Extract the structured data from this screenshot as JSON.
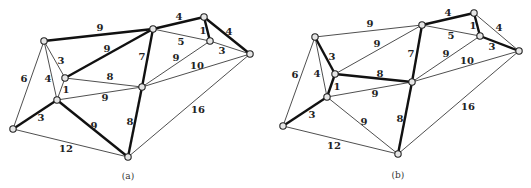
{
  "figures": [
    {
      "id": "a",
      "caption": "(a)",
      "caption_pos": [
        128,
        176
      ],
      "nodes": {
        "A": [
          44,
          41
        ],
        "B": [
          153,
          29
        ],
        "C": [
          204,
          17
        ],
        "D": [
          210,
          41
        ],
        "E": [
          250,
          54
        ],
        "F": [
          65,
          78
        ],
        "G": [
          142,
          87
        ],
        "H": [
          57,
          100
        ],
        "I": [
          13,
          129
        ],
        "J": [
          128,
          157
        ]
      },
      "edges": [
        {
          "from": "A",
          "to": "B",
          "w": "9",
          "thick": true,
          "lp": [
            100,
            28
          ]
        },
        {
          "from": "B",
          "to": "C",
          "w": "4",
          "thick": true,
          "lp": [
            179,
            17
          ]
        },
        {
          "from": "C",
          "to": "D",
          "w": "1",
          "thick": true,
          "lp": [
            203,
            31
          ]
        },
        {
          "from": "C",
          "to": "E",
          "w": "4",
          "thick": true,
          "lp": [
            229,
            32
          ]
        },
        {
          "from": "B",
          "to": "D",
          "w": "5",
          "thick": false,
          "lp": [
            181,
            42
          ]
        },
        {
          "from": "D",
          "to": "E",
          "w": "3",
          "thick": false,
          "lp": [
            222,
            51
          ]
        },
        {
          "from": "B",
          "to": "F",
          "w": "9",
          "thick": true,
          "lp": [
            107,
            49
          ]
        },
        {
          "from": "B",
          "to": "G",
          "w": "7",
          "thick": true,
          "lp": [
            142,
            57
          ]
        },
        {
          "from": "G",
          "to": "D",
          "w": "9",
          "thick": false,
          "lp": [
            176,
            58
          ]
        },
        {
          "from": "G",
          "to": "E",
          "w": "10",
          "thick": false,
          "lp": [
            197,
            66
          ]
        },
        {
          "from": "F",
          "to": "G",
          "w": "8",
          "thick": false,
          "lp": [
            110,
            77
          ]
        },
        {
          "from": "H",
          "to": "G",
          "w": "9",
          "thick": false,
          "lp": [
            105,
            98
          ]
        },
        {
          "from": "A",
          "to": "F",
          "w": "3",
          "thick": false,
          "lp": [
            61,
            61
          ]
        },
        {
          "from": "A",
          "to": "H",
          "w": "4",
          "thick": false,
          "lp": [
            48,
            79
          ]
        },
        {
          "from": "F",
          "to": "H",
          "w": "1",
          "thick": false,
          "lp": [
            66,
            90
          ]
        },
        {
          "from": "A",
          "to": "I",
          "w": "6",
          "thick": false,
          "lp": [
            24,
            79
          ]
        },
        {
          "from": "H",
          "to": "I",
          "w": "3",
          "thick": true,
          "lp": [
            41,
            118
          ]
        },
        {
          "from": "H",
          "to": "J",
          "w": "9",
          "thick": true,
          "lp": [
            94,
            126
          ]
        },
        {
          "from": "G",
          "to": "J",
          "w": "8",
          "thick": true,
          "lp": [
            130,
            122
          ]
        },
        {
          "from": "I",
          "to": "J",
          "w": "12",
          "thick": false,
          "lp": [
            66,
            149
          ]
        },
        {
          "from": "E",
          "to": "J",
          "w": "16",
          "thick": false,
          "lp": [
            198,
            110
          ]
        }
      ]
    },
    {
      "id": "b",
      "caption": "(b)",
      "caption_pos": [
        398,
        175
      ],
      "nodes": {
        "A": [
          315,
          37
        ],
        "B": [
          422,
          25
        ],
        "C": [
          474,
          13
        ],
        "D": [
          480,
          36
        ],
        "E": [
          519,
          51
        ],
        "F": [
          335,
          74
        ],
        "G": [
          412,
          82
        ],
        "H": [
          327,
          97
        ],
        "I": [
          283,
          126
        ],
        "J": [
          398,
          154
        ]
      },
      "edges": [
        {
          "from": "A",
          "to": "B",
          "w": "9",
          "thick": false,
          "lp": [
            370,
            24
          ]
        },
        {
          "from": "B",
          "to": "C",
          "w": "4",
          "thick": true,
          "lp": [
            448,
            13
          ]
        },
        {
          "from": "C",
          "to": "D",
          "w": "1",
          "thick": true,
          "lp": [
            473,
            26
          ]
        },
        {
          "from": "C",
          "to": "E",
          "w": "4",
          "thick": false,
          "lp": [
            499,
            28
          ]
        },
        {
          "from": "B",
          "to": "D",
          "w": "5",
          "thick": false,
          "lp": [
            451,
            36
          ]
        },
        {
          "from": "D",
          "to": "E",
          "w": "3",
          "thick": true,
          "lp": [
            492,
            47
          ]
        },
        {
          "from": "B",
          "to": "F",
          "w": "9",
          "thick": false,
          "lp": [
            377,
            44
          ]
        },
        {
          "from": "B",
          "to": "G",
          "w": "7",
          "thick": true,
          "lp": [
            411,
            54
          ]
        },
        {
          "from": "G",
          "to": "D",
          "w": "9",
          "thick": false,
          "lp": [
            446,
            54
          ]
        },
        {
          "from": "G",
          "to": "E",
          "w": "10",
          "thick": false,
          "lp": [
            467,
            61
          ]
        },
        {
          "from": "F",
          "to": "G",
          "w": "8",
          "thick": true,
          "lp": [
            380,
            74
          ]
        },
        {
          "from": "H",
          "to": "G",
          "w": "9",
          "thick": false,
          "lp": [
            375,
            94
          ]
        },
        {
          "from": "A",
          "to": "F",
          "w": "3",
          "thick": true,
          "lp": [
            332,
            57
          ]
        },
        {
          "from": "A",
          "to": "H",
          "w": "4",
          "thick": false,
          "lp": [
            317,
            74
          ]
        },
        {
          "from": "F",
          "to": "H",
          "w": "1",
          "thick": true,
          "lp": [
            337,
            87
          ]
        },
        {
          "from": "A",
          "to": "I",
          "w": "6",
          "thick": false,
          "lp": [
            295,
            75
          ]
        },
        {
          "from": "H",
          "to": "I",
          "w": "3",
          "thick": true,
          "lp": [
            312,
            115
          ]
        },
        {
          "from": "H",
          "to": "J",
          "w": "9",
          "thick": false,
          "lp": [
            364,
            122
          ]
        },
        {
          "from": "G",
          "to": "J",
          "w": "8",
          "thick": true,
          "lp": [
            400,
            119
          ]
        },
        {
          "from": "I",
          "to": "J",
          "w": "12",
          "thick": false,
          "lp": [
            334,
            146
          ]
        },
        {
          "from": "E",
          "to": "J",
          "w": "16",
          "thick": false,
          "lp": [
            468,
            107
          ]
        }
      ]
    }
  ]
}
